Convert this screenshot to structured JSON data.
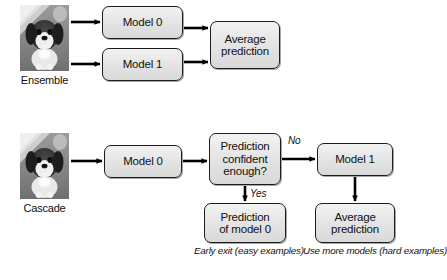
{
  "diagram": {
    "title_visible": false,
    "type": "flowchart",
    "colors": {
      "node_fill": "#e6e6e6",
      "node_border": "#1c1c1c",
      "arrow": "#000000",
      "background": "#ffffff"
    },
    "rows": [
      {
        "id": "ensemble",
        "label": "Ensemble",
        "input_icon": "dog-photo-thumbnail",
        "nodes": [
          {
            "id": "ens-model-0",
            "lines": [
              "Model 0"
            ]
          },
          {
            "id": "ens-model-1",
            "lines": [
              "Model 1"
            ]
          },
          {
            "id": "ens-average",
            "lines": [
              "Average",
              "prediction"
            ]
          }
        ]
      },
      {
        "id": "cascade",
        "label": "Cascade",
        "input_icon": "dog-photo-thumbnail",
        "nodes": [
          {
            "id": "cas-model-0",
            "lines": [
              "Model 0"
            ]
          },
          {
            "id": "cas-decision",
            "lines": [
              "Prediction",
              "confident",
              "enough?"
            ]
          },
          {
            "id": "cas-model-1",
            "lines": [
              "Model 1"
            ]
          },
          {
            "id": "cas-pred-model-0",
            "lines": [
              "Prediction",
              "of model 0"
            ]
          },
          {
            "id": "cas-average",
            "lines": [
              "Average",
              "prediction"
            ]
          }
        ],
        "edge_labels": [
          {
            "id": "branch-no",
            "text": "No"
          },
          {
            "id": "branch-yes",
            "text": "Yes"
          }
        ],
        "notes": [
          {
            "id": "note-early-exit",
            "lines": [
              "Early exit",
              "(easy examples)"
            ]
          },
          {
            "id": "note-more-models",
            "lines": [
              "Use more models",
              "(hard examples)"
            ]
          }
        ]
      }
    ]
  }
}
